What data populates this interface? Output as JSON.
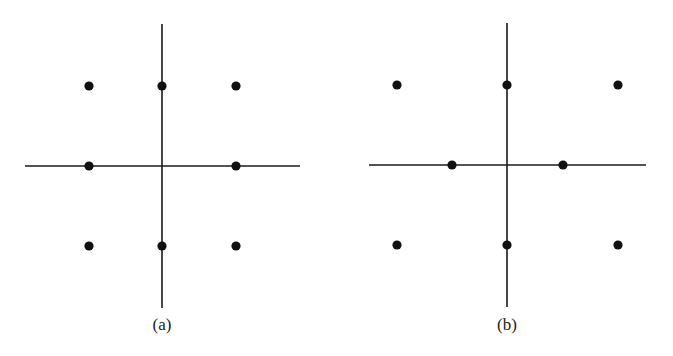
{
  "figure": {
    "panels": [
      {
        "id": "a",
        "caption": "(a)",
        "origin": [
          162,
          166
        ],
        "vaxis": {
          "x": 162,
          "y1": 24,
          "y2": 308
        },
        "haxis": {
          "y": 166,
          "x1": 25,
          "x2": 300
        },
        "caption_pos": [
          162,
          330
        ],
        "points": [
          [
            89,
            86
          ],
          [
            162,
            86
          ],
          [
            236,
            86
          ],
          [
            89,
            166
          ],
          [
            236,
            166
          ],
          [
            89,
            246
          ],
          [
            162,
            246
          ],
          [
            236,
            246
          ]
        ]
      },
      {
        "id": "b",
        "caption": "(b)",
        "origin": [
          507,
          165
        ],
        "vaxis": {
          "x": 507,
          "y1": 23,
          "y2": 307
        },
        "haxis": {
          "y": 165,
          "x1": 369,
          "x2": 646
        },
        "caption_pos": [
          507,
          330
        ],
        "points": [
          [
            397,
            85
          ],
          [
            507,
            85
          ],
          [
            618,
            85
          ],
          [
            452,
            165
          ],
          [
            563,
            165
          ],
          [
            397,
            245
          ],
          [
            507,
            245
          ],
          [
            618,
            245
          ]
        ]
      }
    ],
    "colors": {
      "ink": "#111111",
      "background": "#ffffff"
    }
  }
}
